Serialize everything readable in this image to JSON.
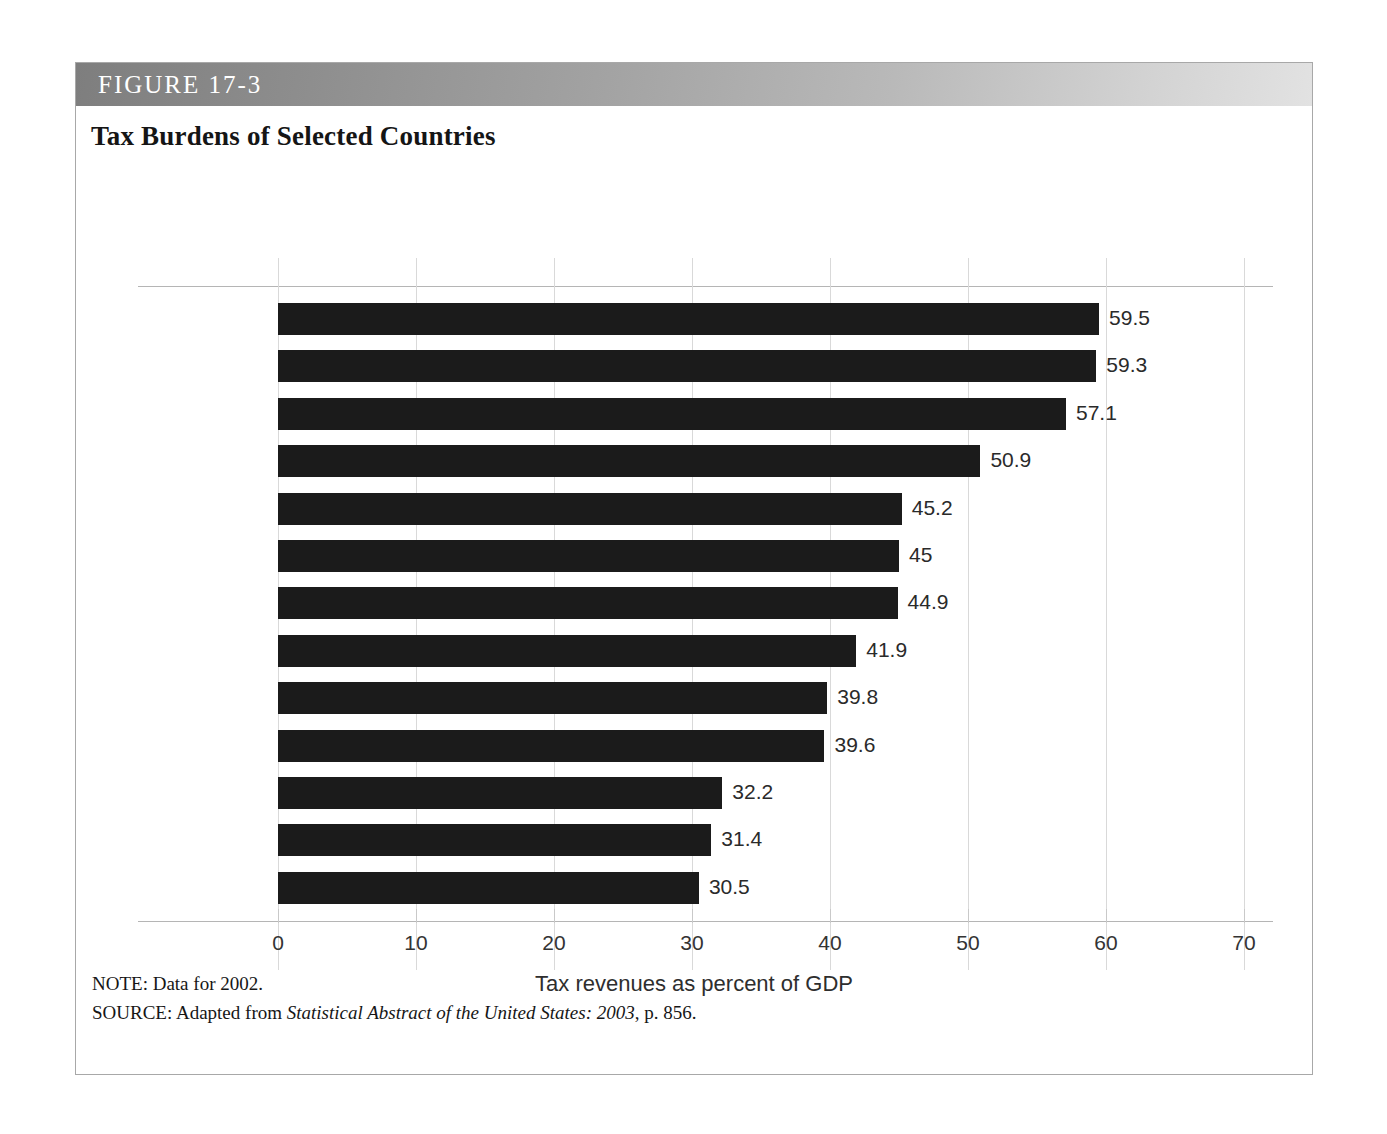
{
  "figure": {
    "header_label": "FIGURE 17-3",
    "title": "Tax Burdens of Selected Countries",
    "note": "NOTE: Data for 2002.",
    "source_prefix": "SOURCE: Adapted from ",
    "source_italic": "Statistical Abstract of the United States: 2003",
    "source_suffix": ", p. 856."
  },
  "chart_data": {
    "type": "bar",
    "orientation": "horizontal",
    "title": "Tax Burdens of Selected Countries",
    "xlabel": "Tax revenues as percent of GDP",
    "ylabel": "",
    "xlim": [
      0,
      70
    ],
    "xticks": [
      0,
      10,
      20,
      30,
      40,
      50,
      60,
      70
    ],
    "xtick_labels": [
      "0",
      "10",
      "20",
      "30",
      "40",
      "50",
      "60",
      "70"
    ],
    "grid": true,
    "legend": "none",
    "bar_color": "#1b1b1b",
    "categories": [
      "Norway",
      "Sweden",
      "Denmark",
      "France",
      "Italy",
      "Germany",
      "Iceland",
      "Canada",
      "Spain",
      "United Kingdom",
      "United States",
      "Japan",
      "South Korea"
    ],
    "category_lines": [
      [
        "Norway"
      ],
      [
        "Sweden"
      ],
      [
        "Denmark"
      ],
      [
        "France"
      ],
      [
        "Italy"
      ],
      [
        "Germany"
      ],
      [
        "Iceland"
      ],
      [
        "Canada"
      ],
      [
        "Spain"
      ],
      [
        "United",
        "Kingdom"
      ],
      [
        "United",
        "States"
      ],
      [
        "Japan"
      ],
      [
        "South",
        "Korea"
      ]
    ],
    "values": [
      59.5,
      59.3,
      57.1,
      50.9,
      45.2,
      45,
      44.9,
      41.9,
      39.8,
      39.6,
      32.2,
      31.4,
      30.5
    ],
    "value_labels": [
      "59.5",
      "59.3",
      "57.1",
      "50.9",
      "45.2",
      "45",
      "44.9",
      "41.9",
      "39.8",
      "39.6",
      "32.2",
      "31.4",
      "30.5"
    ]
  }
}
